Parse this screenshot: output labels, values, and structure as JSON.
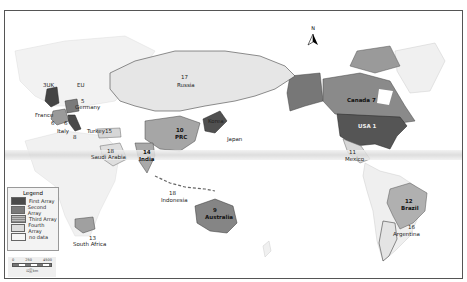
{
  "map": {
    "north_arrow_label": "N",
    "colors": {
      "first_array": "#4a4a4a",
      "second_array": "#7a7a7a",
      "third_array": "#a8a8a8",
      "fourth_array": "#dcdcdc",
      "no_data": "#f4f4f4"
    },
    "country_labels": [
      {
        "id": "uk",
        "text": "3UK"
      },
      {
        "id": "eu",
        "text": "EU"
      },
      {
        "id": "germany_num",
        "text": "5"
      },
      {
        "id": "germany",
        "text": "Germany"
      },
      {
        "id": "france",
        "text": "France"
      },
      {
        "id": "france_num",
        "text": "6"
      },
      {
        "id": "italy_num",
        "text": "6"
      },
      {
        "id": "italy",
        "text": "Italy"
      },
      {
        "id": "italy_num2",
        "text": "8"
      },
      {
        "id": "turkey",
        "text": "Turkey15"
      },
      {
        "id": "saudi_num",
        "text": "18"
      },
      {
        "id": "saudi",
        "text": "Saudi Arabia"
      },
      {
        "id": "russia_num",
        "text": "17"
      },
      {
        "id": "russia",
        "text": "Russia"
      },
      {
        "id": "prc_num",
        "text": "10"
      },
      {
        "id": "prc",
        "text": "PRC"
      },
      {
        "id": "korea",
        "text": "Korea"
      },
      {
        "id": "japan",
        "text": "Japan"
      },
      {
        "id": "india_num",
        "text": "14"
      },
      {
        "id": "india",
        "text": "India"
      },
      {
        "id": "indonesia_num",
        "text": "18"
      },
      {
        "id": "indonesia",
        "text": "Indonesia"
      },
      {
        "id": "australia_num",
        "text": "9"
      },
      {
        "id": "australia",
        "text": "Australia"
      },
      {
        "id": "southafrica_num",
        "text": "13"
      },
      {
        "id": "southafrica",
        "text": "South Africa"
      },
      {
        "id": "canada",
        "text": "Canada 7"
      },
      {
        "id": "usa",
        "text": "USA 1"
      },
      {
        "id": "mexico_num",
        "text": "11"
      },
      {
        "id": "mexico",
        "text": "Mexico"
      },
      {
        "id": "brazil_num",
        "text": "12"
      },
      {
        "id": "brazil",
        "text": "Brazil"
      },
      {
        "id": "argentina_num",
        "text": "16"
      },
      {
        "id": "argentina",
        "text": "Argentina"
      }
    ]
  },
  "legend": {
    "title": "Legend",
    "items": [
      {
        "label": "First Array"
      },
      {
        "label": "Second Array"
      },
      {
        "label": "Third Array"
      },
      {
        "label": "Fourth Array"
      },
      {
        "label": "no data"
      }
    ]
  },
  "scale_bar": {
    "ticks": [
      "0",
      "250",
      "4500"
    ],
    "unit": "公里 km"
  }
}
